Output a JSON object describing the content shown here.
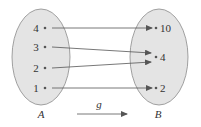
{
  "diagram": {
    "function_label": "g",
    "domain_set": {
      "label": "A",
      "elements": [
        "4",
        "3",
        "2",
        "1"
      ]
    },
    "codomain_set": {
      "label": "B",
      "elements": [
        "10",
        "4",
        "2"
      ]
    },
    "mappings": [
      {
        "from": "4",
        "to": "10"
      },
      {
        "from": "3",
        "to": "4"
      },
      {
        "from": "2",
        "to": "4"
      },
      {
        "from": "1",
        "to": "2"
      }
    ],
    "colors": {
      "ellipse_fill": "#e4e4e4",
      "ellipse_stroke": "#8a8a8a",
      "arrow": "#555555",
      "text": "#333333"
    }
  }
}
